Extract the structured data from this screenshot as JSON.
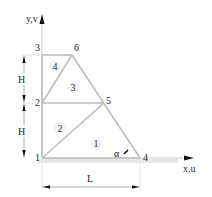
{
  "diagram": {
    "axes": {
      "y_label": "y,v",
      "x_label": "x,u"
    },
    "nodes": [
      {
        "id": "1",
        "x": 42,
        "y": 158
      },
      {
        "id": "2",
        "x": 42,
        "y": 103
      },
      {
        "id": "3",
        "x": 42,
        "y": 55
      },
      {
        "id": "4",
        "x": 140,
        "y": 158
      },
      {
        "id": "5",
        "x": 104,
        "y": 103
      },
      {
        "id": "6",
        "x": 72,
        "y": 55
      }
    ],
    "elements": [
      {
        "id": "1",
        "nodes": [
          "1",
          "4",
          "5"
        ]
      },
      {
        "id": "2",
        "nodes": [
          "1",
          "5",
          "2"
        ]
      },
      {
        "id": "3",
        "nodes": [
          "2",
          "5",
          "6"
        ]
      },
      {
        "id": "4",
        "nodes": [
          "2",
          "6",
          "3"
        ]
      }
    ],
    "dimensions": {
      "height_upper": "H",
      "height_lower": "H",
      "length": "L"
    },
    "angle_label": "α",
    "colors": {
      "edge": "#bdbdbd",
      "text": "#222222",
      "ground": "#cfcfcf"
    }
  }
}
